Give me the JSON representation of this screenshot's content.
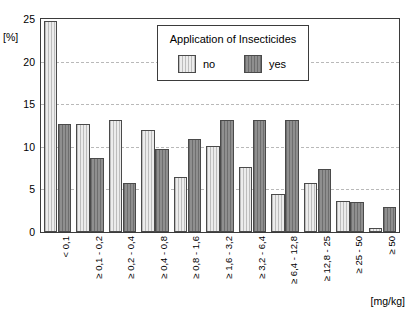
{
  "chart_data": {
    "type": "bar",
    "title": "",
    "xlabel": "[mg/kg]",
    "ylabel": "[%]",
    "ylim": [
      0,
      25
    ],
    "yticks": [
      0,
      5,
      10,
      15,
      20,
      25
    ],
    "grid": true,
    "legend_position": "top-center",
    "legend_title": "Application of Insecticides",
    "categories": [
      "< 0,1",
      "≥ 0,1 - 0,2",
      "≥ 0,2 - 0,4",
      "≥ 0,4 - 0,8",
      "≥ 0,8 - 1,6",
      "≥ 1,6 - 3,2",
      "≥ 3,2 - 6,4",
      "≥ 6,4 - 12,8",
      "≥ 12,8 - 25",
      "≥ 25 - 50",
      "≥ 50"
    ],
    "series": [
      {
        "name": "no",
        "values": [
          24.8,
          12.7,
          13.2,
          12.0,
          6.4,
          10.1,
          7.6,
          4.5,
          5.7,
          3.6,
          0.5
        ]
      },
      {
        "name": "yes",
        "values": [
          12.7,
          8.7,
          5.8,
          9.8,
          10.9,
          13.1,
          13.1,
          13.1,
          7.4,
          3.5,
          2.9
        ]
      }
    ]
  },
  "colors": {
    "series_no": "#ececec",
    "series_yes": "#8f8f8f",
    "frame": "#3b3b3b",
    "grid": "#b9b9b9",
    "background": "#ffffff"
  }
}
